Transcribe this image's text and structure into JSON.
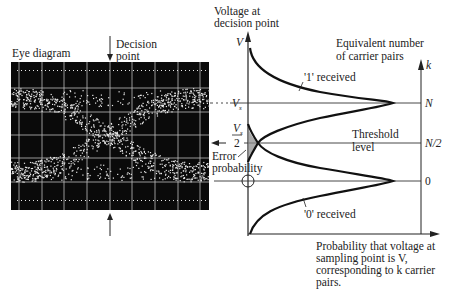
{
  "eye_diagram": {
    "title": "Eye diagram",
    "decision_label_line1": "Decision",
    "decision_label_line2": "point"
  },
  "plot": {
    "y_axis_title_line1": "Voltage at",
    "y_axis_title_line2": "decision point",
    "y_axis_symbol": "V",
    "right_axis_title_line1": "Equivalent number",
    "right_axis_title_line2": "of carrier pairs",
    "right_axis_symbol": "k",
    "vs_label": "V",
    "vs_sub": "s",
    "half_vs_num": "V",
    "half_vs_sub": "s",
    "half_vs_den": "2",
    "right_ticks": [
      "N",
      "N/2",
      "0"
    ],
    "one_received": "'1' received",
    "zero_received": "'0' received",
    "threshold_line1": "Threshold",
    "threshold_line2": "level",
    "error_line1": "Error",
    "error_line2": "probability",
    "x_axis_caption": [
      "Probability that voltage at",
      "sampling point is V,",
      "corresponding to k carrier",
      "pairs."
    ]
  },
  "colors": {
    "ink": "#222222",
    "scope_bg": "#0a0a0a",
    "trace": "#e8e8e8"
  }
}
